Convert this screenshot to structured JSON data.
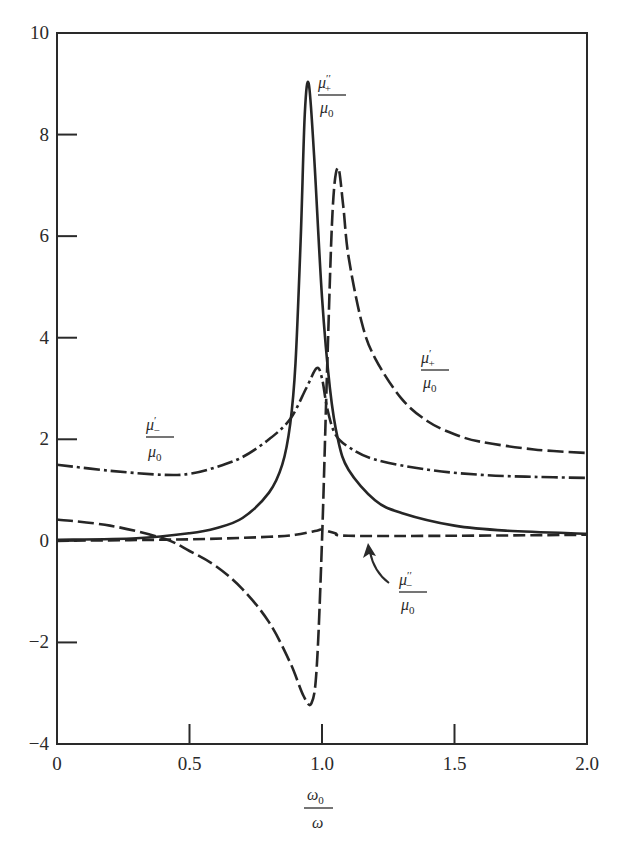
{
  "chart_data": {
    "type": "line",
    "title": "",
    "xlabel": "ω0 / ω",
    "ylabel": "",
    "xlim": [
      0,
      2.0
    ],
    "ylim": [
      -4,
      10
    ],
    "grid": false,
    "legend": "inline labels",
    "x_ticks": [
      {
        "value": 0,
        "label": "0"
      },
      {
        "value": 0.5,
        "label": "0.5"
      },
      {
        "value": 1.0,
        "label": "1.0"
      },
      {
        "value": 1.5,
        "label": "1.5"
      },
      {
        "value": 2.0,
        "label": "2.0"
      }
    ],
    "y_ticks": [
      {
        "value": -4,
        "label": "−4"
      },
      {
        "value": -2,
        "label": "−2"
      },
      {
        "value": 0,
        "label": "0"
      },
      {
        "value": 2,
        "label": "2"
      },
      {
        "value": 4,
        "label": "4"
      },
      {
        "value": 6,
        "label": "6"
      },
      {
        "value": 8,
        "label": "8"
      },
      {
        "value": 10,
        "label": "10"
      }
    ],
    "series": [
      {
        "name": "μ''+ / μ0",
        "style": "solid",
        "x": [
          0,
          0.3,
          0.5,
          0.6,
          0.7,
          0.8,
          0.85,
          0.88,
          0.9,
          0.92,
          0.935,
          0.95,
          0.97,
          1.0,
          1.03,
          1.06,
          1.1,
          1.2,
          1.3,
          1.5,
          1.7,
          2.0
        ],
        "y": [
          0.02,
          0.05,
          0.15,
          0.25,
          0.45,
          0.95,
          1.5,
          2.3,
          3.5,
          6.0,
          8.4,
          9.0,
          7.6,
          4.8,
          3.0,
          2.0,
          1.4,
          0.8,
          0.55,
          0.3,
          0.2,
          0.14
        ]
      },
      {
        "name": "μ'+ / μ0",
        "style": "long-dash",
        "x": [
          0,
          0.2,
          0.4,
          0.5,
          0.6,
          0.7,
          0.8,
          0.88,
          0.93,
          0.96,
          0.98,
          1.0,
          1.02,
          1.04,
          1.06,
          1.08,
          1.1,
          1.15,
          1.2,
          1.3,
          1.4,
          1.5,
          1.6,
          1.8,
          2.0
        ],
        "y": [
          0.42,
          0.3,
          0.05,
          -0.2,
          -0.5,
          -0.95,
          -1.6,
          -2.4,
          -3.05,
          -3.2,
          -2.5,
          0.0,
          3.5,
          6.5,
          7.35,
          6.6,
          5.6,
          4.3,
          3.6,
          2.8,
          2.35,
          2.1,
          1.95,
          1.8,
          1.73
        ]
      },
      {
        "name": "μ'- / μ0",
        "style": "dash-dot",
        "x": [
          0,
          0.2,
          0.4,
          0.5,
          0.6,
          0.7,
          0.8,
          0.88,
          0.94,
          0.98,
          1.0,
          1.02,
          1.05,
          1.1,
          1.2,
          1.4,
          1.6,
          1.8,
          2.0
        ],
        "y": [
          1.5,
          1.38,
          1.3,
          1.32,
          1.45,
          1.65,
          2.0,
          2.4,
          3.0,
          3.4,
          3.2,
          2.6,
          2.1,
          1.85,
          1.6,
          1.4,
          1.3,
          1.26,
          1.24
        ]
      },
      {
        "name": "μ''- / μ0",
        "style": "dashed",
        "x": [
          0,
          0.5,
          0.8,
          0.9,
          0.98,
          1.0,
          1.05,
          1.1,
          1.5,
          2.0
        ],
        "y": [
          0.0,
          0.03,
          0.08,
          0.12,
          0.2,
          0.22,
          0.15,
          0.1,
          0.1,
          0.12
        ]
      }
    ],
    "annotations": [
      {
        "text": "μ''+ / μ0",
        "x": 1.18,
        "y": 8.9
      },
      {
        "text": "μ'+ / μ0",
        "x": 1.42,
        "y": 3.5
      },
      {
        "text": "μ'- / μ0",
        "x": 0.33,
        "y": 2.0
      },
      {
        "text": "μ''- / μ0",
        "x": 1.34,
        "y": -0.8,
        "arrow_to": [
          1.18,
          0.1
        ]
      }
    ]
  },
  "labels": {
    "mu_pp_plus": {
      "num": "μ",
      "sup": "′′",
      "sub": "+",
      "den": "μ",
      "den_sub": "0"
    },
    "mu_p_plus": {
      "num": "μ",
      "sup": "′",
      "sub": "+",
      "den": "μ",
      "den_sub": "0"
    },
    "mu_p_minus": {
      "num": "μ",
      "sup": "′",
      "sub": "−",
      "den": "μ",
      "den_sub": "0"
    },
    "mu_pp_minus": {
      "num": "μ",
      "sup": "′′",
      "sub": "−",
      "den": "μ",
      "den_sub": "0"
    },
    "xaxis": {
      "num": "ω",
      "num_sub": "0",
      "den": "ω"
    }
  }
}
